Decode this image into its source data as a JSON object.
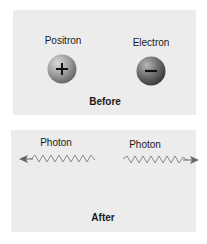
{
  "before": {
    "caption": "Before",
    "particles": [
      {
        "label": "Positron",
        "symbol": "+",
        "icon": "plus-icon",
        "color": "#9a9a9a"
      },
      {
        "label": "Electron",
        "symbol": "−",
        "icon": "minus-icon",
        "color": "#6e6e6e"
      }
    ]
  },
  "after": {
    "caption": "After",
    "photons": [
      {
        "label": "Photon",
        "direction": "left",
        "icon": "wave-arrow-left-icon"
      },
      {
        "label": "Photon",
        "direction": "right",
        "icon": "wave-arrow-right-icon"
      }
    ]
  },
  "colors": {
    "panel_bg": "#ececec",
    "wave": "#8a8a8a"
  }
}
